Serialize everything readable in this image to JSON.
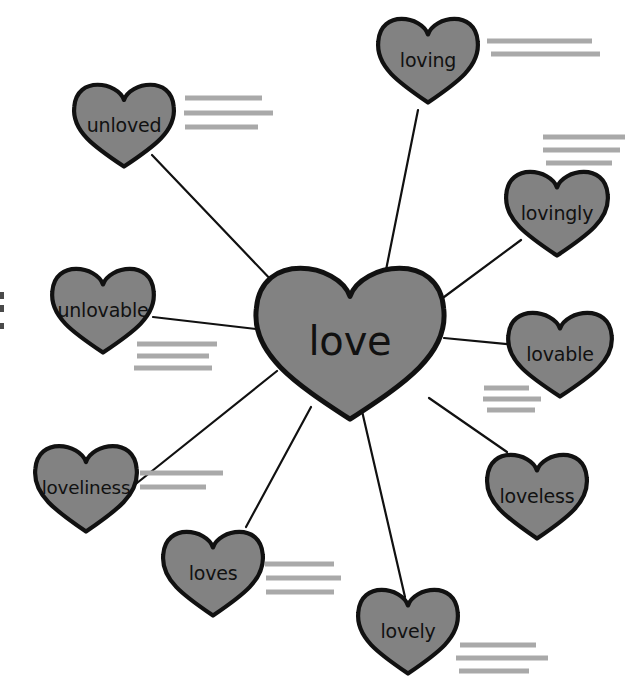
{
  "diagram": {
    "type": "word-web",
    "root": {
      "label": "love",
      "cx": 350,
      "cy": 337,
      "w": 196,
      "h": 166,
      "font_size": 40
    },
    "colors": {
      "heart_fill": "#828282",
      "heart_stroke": "#111111",
      "connector": "#111111",
      "writing_line": "#a9a9a9",
      "background": "#ffffff",
      "label_text": "#111111"
    },
    "branches": [
      {
        "label": "loving",
        "cx": 428,
        "cy": 57,
        "w": 104,
        "h": 92,
        "font_size": 19,
        "connect_from": [
          385,
          275
        ],
        "connect_to": [
          418,
          110
        ],
        "lines": [
          {
            "x1": 487,
            "y1": 41,
            "x2": 592,
            "y2": 41
          },
          {
            "x1": 491,
            "y1": 54,
            "x2": 600,
            "y2": 54
          }
        ]
      },
      {
        "label": "unloved",
        "cx": 124,
        "cy": 122,
        "w": 104,
        "h": 90,
        "font_size": 19,
        "connect_from": [
          275,
          284
        ],
        "connect_to": [
          152,
          155
        ],
        "lines": [
          {
            "x1": 185,
            "y1": 98,
            "x2": 262,
            "y2": 98
          },
          {
            "x1": 184,
            "y1": 113,
            "x2": 273,
            "y2": 113
          },
          {
            "x1": 185,
            "y1": 127,
            "x2": 258,
            "y2": 127
          }
        ]
      },
      {
        "label": "lovingly",
        "cx": 557,
        "cy": 210,
        "w": 106,
        "h": 92,
        "font_size": 19,
        "connect_from": [
          440,
          300
        ],
        "connect_to": [
          521,
          240
        ],
        "lines": [
          {
            "x1": 543,
            "y1": 137,
            "x2": 625,
            "y2": 137
          },
          {
            "x1": 543,
            "y1": 150,
            "x2": 620,
            "y2": 150
          },
          {
            "x1": 546,
            "y1": 163,
            "x2": 612,
            "y2": 163
          }
        ]
      },
      {
        "label": "unlovable",
        "cx": 103,
        "cy": 307,
        "w": 106,
        "h": 92,
        "font_size": 19,
        "connect_from": [
          256,
          329
        ],
        "connect_to": [
          153,
          317
        ],
        "lines": [
          {
            "x1": 137,
            "y1": 344,
            "x2": 217,
            "y2": 344
          },
          {
            "x1": 137,
            "y1": 356,
            "x2": 209,
            "y2": 356
          },
          {
            "x1": 134,
            "y1": 368,
            "x2": 212,
            "y2": 368
          }
        ]
      },
      {
        "label": "lovable",
        "cx": 560,
        "cy": 351,
        "w": 108,
        "h": 92,
        "font_size": 19,
        "connect_from": [
          444,
          338
        ],
        "connect_to": [
          516,
          345
        ],
        "lines": [
          {
            "x1": 484,
            "y1": 388,
            "x2": 529,
            "y2": 388
          },
          {
            "x1": 483,
            "y1": 399,
            "x2": 541,
            "y2": 399
          },
          {
            "x1": 487,
            "y1": 410,
            "x2": 535,
            "y2": 410
          }
        ]
      },
      {
        "label": "loveless",
        "cx": 537,
        "cy": 493,
        "w": 104,
        "h": 92,
        "font_size": 19,
        "connect_from": [
          429,
          398
        ],
        "connect_to": [
          507,
          452
        ],
        "lines": []
      },
      {
        "label": "loveliness",
        "cx": 86,
        "cy": 485,
        "w": 106,
        "h": 94,
        "font_size": 19,
        "connect_from": [
          277,
          371
        ],
        "connect_to": [
          132,
          487
        ],
        "lines": [
          {
            "x1": 140,
            "y1": 473,
            "x2": 223,
            "y2": 473
          },
          {
            "x1": 140,
            "y1": 487,
            "x2": 206,
            "y2": 487
          }
        ]
      },
      {
        "label": "loves",
        "cx": 213,
        "cy": 570,
        "w": 104,
        "h": 92,
        "font_size": 19,
        "connect_from": [
          311,
          407
        ],
        "connect_to": [
          246,
          527
        ],
        "lines": [
          {
            "x1": 265,
            "y1": 564,
            "x2": 334,
            "y2": 564
          },
          {
            "x1": 266,
            "y1": 578,
            "x2": 341,
            "y2": 578
          },
          {
            "x1": 266,
            "y1": 592,
            "x2": 334,
            "y2": 592
          }
        ]
      },
      {
        "label": "lovely",
        "cx": 408,
        "cy": 628,
        "w": 104,
        "h": 92,
        "font_size": 19,
        "connect_from": [
          362,
          411
        ],
        "connect_to": [
          405,
          597
        ],
        "lines": [
          {
            "x1": 460,
            "y1": 645,
            "x2": 536,
            "y2": 645
          },
          {
            "x1": 456,
            "y1": 658,
            "x2": 548,
            "y2": 658
          },
          {
            "x1": 459,
            "y1": 671,
            "x2": 529,
            "y2": 671
          }
        ]
      }
    ],
    "edge_marks": [
      {
        "x": 0,
        "y": 292,
        "w": 4,
        "h": 7
      },
      {
        "x": 0,
        "y": 305,
        "w": 4,
        "h": 7
      },
      {
        "x": 0,
        "y": 323,
        "w": 4,
        "h": 6
      }
    ]
  }
}
